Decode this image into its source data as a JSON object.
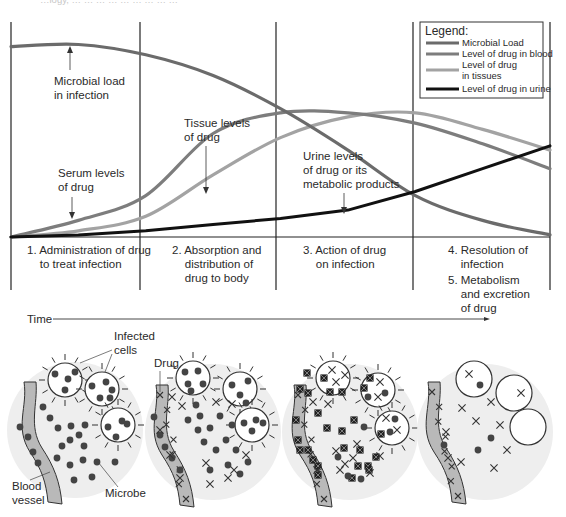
{
  "figure": {
    "top_caption_fragment": "…logy, … … … … … … … … …",
    "colors": {
      "microbial_load": "#6b6b6b",
      "drug_blood": "#7d7d7d",
      "drug_tissues": "#a3a3a3",
      "drug_urine": "#111111",
      "frame": "#222222",
      "vessel_fill": "#b9b9b9",
      "circle_bg": "#eeeeee",
      "microbe": "#444444"
    }
  },
  "legend": {
    "title": "Legend:",
    "items": [
      {
        "label": "Microbial Load",
        "series": "microbial_load"
      },
      {
        "label": "Level of drug in blood",
        "series": "drug_blood"
      },
      {
        "label_lines": [
          "Level of drug",
          "in tissues"
        ],
        "series": "drug_tissues"
      },
      {
        "label": "Level of drug in urine",
        "series": "drug_urine"
      }
    ]
  },
  "annotations": {
    "microbial_load": [
      "Microbial load",
      "in infection"
    ],
    "serum": [
      "Serum levels",
      "of drug"
    ],
    "tissue": [
      "Tissue levels",
      "of drug"
    ],
    "urine": [
      "Urine levels",
      "of drug or its",
      "metabolic products"
    ]
  },
  "stages": [
    {
      "lines": [
        "1. Administration of drug",
        "    to treat infection"
      ]
    },
    {
      "lines": [
        "2. Absorption and",
        "    distribution of",
        "    drug to body"
      ]
    },
    {
      "lines": [
        "3. Action of drug",
        "    on infection"
      ]
    },
    {
      "lines": [
        "4. Resolution of",
        "    infection",
        "5. Metabolism",
        "    and excretion",
        "    of drug"
      ]
    }
  ],
  "time_axis": {
    "label": "Time"
  },
  "illustration_labels": {
    "infected_cells": [
      "Infected",
      "cells"
    ],
    "drug": "Drug",
    "blood_vessel": [
      "Blood",
      "vessel"
    ],
    "microbe": "Microbe"
  },
  "chart_data": {
    "type": "line",
    "title": "",
    "xlabel": "Time",
    "ylabel": "",
    "x_stages": [
      "1",
      "2",
      "3",
      "4-5"
    ],
    "xlim": [
      0,
      4
    ],
    "ylim": [
      0,
      100
    ],
    "grid": false,
    "legend_position": "top-right",
    "x": [
      0,
      0.5,
      1,
      1.5,
      2,
      2.5,
      3,
      3.5,
      4
    ],
    "series": [
      {
        "name": "Microbial Load",
        "key": "microbial_load",
        "values": [
          92,
          93,
          88,
          78,
          62,
          42,
          20,
          8,
          1
        ]
      },
      {
        "name": "Level of drug in blood",
        "key": "drug_blood",
        "values": [
          0,
          8,
          20,
          50,
          60,
          60,
          55,
          45,
          33
        ]
      },
      {
        "name": "Level of drug in tissues",
        "key": "drug_tissues",
        "values": [
          0,
          3,
          10,
          30,
          48,
          58,
          60,
          52,
          42
        ]
      },
      {
        "name": "Level of drug in urine",
        "key": "drug_urine",
        "values": [
          0,
          1,
          3,
          6,
          9,
          13,
          22,
          33,
          44
        ]
      }
    ]
  }
}
